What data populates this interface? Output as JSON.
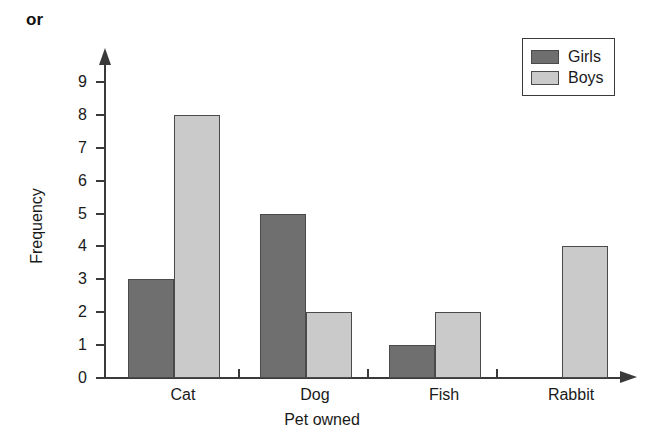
{
  "annotation": {
    "or_text": "or"
  },
  "legend": {
    "position": "top-right",
    "entries": [
      {
        "label": "Girls",
        "color": "#6f6f6f"
      },
      {
        "label": "Boys",
        "color": "#cacaca"
      }
    ]
  },
  "axes": {
    "y_title": "Frequency",
    "x_title": "Pet owned",
    "y_ticks": [
      "0",
      "1",
      "2",
      "3",
      "4",
      "5",
      "6",
      "7",
      "8",
      "9"
    ]
  },
  "chart_data": {
    "type": "bar",
    "title": "",
    "subtitle": "",
    "xlabel": "Pet owned",
    "ylabel": "Frequency",
    "categories": [
      "Cat",
      "Dog",
      "Fish",
      "Rabbit"
    ],
    "series": [
      {
        "name": "Girls",
        "color": "#6f6f6f",
        "values": [
          3,
          5,
          1,
          0
        ]
      },
      {
        "name": "Boys",
        "color": "#cacaca",
        "values": [
          8,
          2,
          2,
          4
        ]
      }
    ],
    "ylim": [
      0,
      9
    ],
    "ytick_step": 1,
    "grid": false,
    "legend_position": "top-right",
    "grouped": true
  }
}
